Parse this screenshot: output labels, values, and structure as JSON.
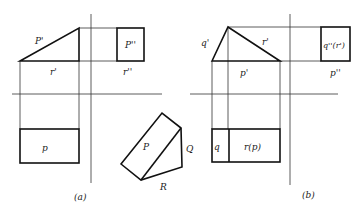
{
  "figure_a": {
    "caption": "(a)",
    "labels": {
      "p_front": "P'",
      "r_front": "r'",
      "p_side": "P''",
      "r_side": "r''",
      "p_top": "p"
    }
  },
  "wedge": {
    "labels": {
      "P": "P",
      "Q": "Q",
      "R": "R"
    }
  },
  "figure_b": {
    "caption": "(b)",
    "labels": {
      "q_front": "q'",
      "r_front": "r'",
      "p_front": "p'",
      "q_side": "q''(r')",
      "p_side": "p''",
      "q_top": "q",
      "r_top": "r(p)"
    }
  }
}
